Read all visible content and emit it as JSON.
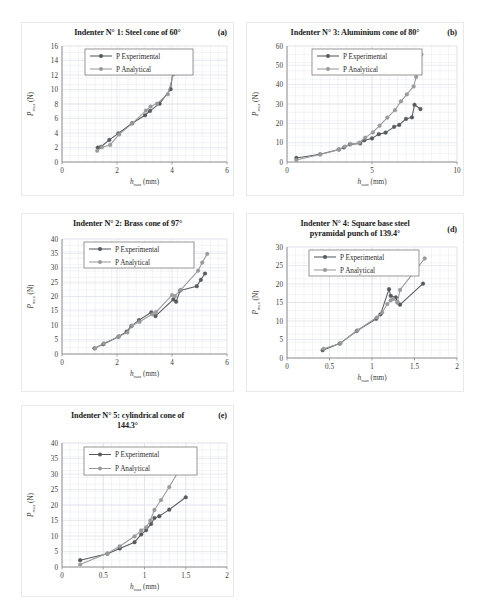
{
  "figure": {
    "background": "#ffffff",
    "panel_border": "#e9e9ec",
    "series_colors": {
      "experimental": "#555a5e",
      "analytical": "#9a9a9a"
    },
    "legend": {
      "experimental_label": "P Experimental",
      "analytical_label": "P Analytical"
    },
    "axis": {
      "y_title_main": "P",
      "y_title_sub": "max",
      "y_title_unit": "(N)",
      "x_title_main": "h",
      "x_title_sub": "max",
      "x_title_unit": "(mm)"
    }
  },
  "chart_data": [
    {
      "type": "line",
      "panel_tag": "(a)",
      "title": "Indenter N° 1: Steel cone of 60°",
      "title_line2": "",
      "xlabel": "h_max (mm)",
      "ylabel": "P_max (N)",
      "xlim": [
        0,
        6
      ],
      "ylim": [
        0,
        16
      ],
      "xticks": [
        0,
        2,
        4,
        6
      ],
      "yticks": [
        0,
        2,
        4,
        6,
        8,
        10,
        12,
        14,
        16
      ],
      "grid": true,
      "legend_position": "top-left",
      "series": [
        {
          "name": "P Experimental",
          "color": "#555a5e",
          "x": [
            1.3,
            1.42,
            1.72,
            2.05,
            2.55,
            3.02,
            3.2,
            3.55,
            3.95,
            4.1
          ],
          "y": [
            2.0,
            2.1,
            3.05,
            3.95,
            5.35,
            6.45,
            7.05,
            8.05,
            10.05,
            14.5
          ]
        },
        {
          "name": "P Analytical",
          "color": "#9a9a9a",
          "x": [
            1.28,
            1.45,
            1.75,
            2.08,
            2.55,
            3.05,
            3.22,
            3.45,
            3.85,
            4.05
          ],
          "y": [
            1.55,
            2.05,
            2.35,
            3.8,
            5.3,
            7.1,
            7.65,
            8.05,
            9.35,
            12.1
          ],
          "x_extra": [
            4.05,
            4.18
          ],
          "y_extra": [
            12.1,
            14.15
          ]
        }
      ]
    },
    {
      "type": "line",
      "panel_tag": "(b)",
      "title": "Indenter N° 3: Aluminium cone of 80°",
      "title_line2": "",
      "xlabel": "h_max (mm)",
      "ylabel": "P_max (N)",
      "xlim": [
        0,
        10
      ],
      "ylim": [
        0,
        60
      ],
      "xticks": [
        0,
        5,
        10
      ],
      "yticks": [
        0,
        10,
        20,
        30,
        40,
        50,
        60
      ],
      "grid": true,
      "legend_position": "top-left",
      "series": [
        {
          "name": "P Experimental",
          "color": "#555a5e",
          "x": [
            0.55,
            1.95,
            3.05,
            3.35,
            3.7,
            4.3,
            4.55,
            5.0,
            5.4,
            5.8,
            6.3,
            6.6,
            7.0,
            7.35,
            7.5,
            7.85
          ],
          "y": [
            2.1,
            4.0,
            6.5,
            7.5,
            9.1,
            9.6,
            11.3,
            12.2,
            14.4,
            15.2,
            18.2,
            19.2,
            22.3,
            23.1,
            29.6,
            27.4
          ]
        },
        {
          "name": "P Analytical",
          "color": "#9a9a9a",
          "x": [
            0.55,
            1.95,
            3.05,
            3.4,
            3.75,
            4.25,
            4.6,
            5.05,
            5.45,
            5.9,
            6.35,
            6.7,
            7.05,
            7.45,
            7.9
          ],
          "y": [
            1.0,
            3.9,
            6.4,
            8.0,
            9.3,
            10.0,
            12.6,
            15.3,
            18.8,
            23.0,
            26.8,
            31.4,
            35.0,
            39.1,
            55.6
          ],
          "x_extra": [
            7.45,
            7.6,
            7.75,
            7.9
          ],
          "y_extra": [
            39.1,
            44.0,
            48.5,
            55.6
          ]
        }
      ]
    },
    {
      "type": "line",
      "panel_tag": "",
      "title": "Indenter N° 2: Brass cone of 97°",
      "title_line2": "",
      "xlabel": "h_max (mm)",
      "ylabel": "P_max (N)",
      "xlim": [
        0,
        6
      ],
      "ylim": [
        0,
        40
      ],
      "xticks": [
        0,
        2,
        4,
        6
      ],
      "yticks": [
        0,
        5,
        10,
        15,
        20,
        25,
        30,
        35,
        40
      ],
      "grid": true,
      "legend_position": "top-left",
      "series": [
        {
          "name": "P Experimental",
          "color": "#555a5e",
          "x": [
            1.18,
            1.5,
            2.05,
            2.35,
            2.52,
            2.8,
            3.25,
            3.4,
            4.05,
            4.15,
            4.3,
            4.9,
            5.05,
            5.2
          ],
          "y": [
            2.0,
            3.4,
            6.0,
            7.8,
            9.7,
            11.8,
            14.5,
            13.2,
            19.0,
            18.2,
            22.1,
            23.6,
            25.8,
            28.0
          ]
        },
        {
          "name": "P Analytical",
          "color": "#9a9a9a",
          "x": [
            1.2,
            1.52,
            2.08,
            2.38,
            2.55,
            2.82,
            3.28,
            3.42,
            4.0,
            4.1,
            4.32,
            4.95,
            5.1,
            5.28
          ],
          "y": [
            1.9,
            3.7,
            6.2,
            7.5,
            9.9,
            11.2,
            13.8,
            14.6,
            20.5,
            20.1,
            22.3,
            29.0,
            31.8,
            34.8
          ]
        }
      ]
    },
    {
      "type": "line",
      "panel_tag": "(d)",
      "title": "Indenter N° 4: Square base steel",
      "title_line2": "pyramidal punch of 139.4°",
      "xlabel": "h_max (mm)",
      "ylabel": "P_max (N)",
      "xlim": [
        0,
        2
      ],
      "ylim": [
        0,
        30
      ],
      "xticks": [
        0,
        0.5,
        1,
        1.5,
        2
      ],
      "xticklabels": [
        "0",
        "0.5",
        "1",
        "1.5",
        "2"
      ],
      "yticks": [
        0,
        5,
        10,
        15,
        20,
        25,
        30
      ],
      "grid": true,
      "legend_position": "top-left",
      "series": [
        {
          "name": "P Experimental",
          "color": "#555a5e",
          "x": [
            0.42,
            0.62,
            0.82,
            1.05,
            1.1,
            1.2,
            1.22,
            1.28,
            1.3,
            1.33,
            1.6
          ],
          "y": [
            2.1,
            3.9,
            7.3,
            10.6,
            11.8,
            18.6,
            16.8,
            16.4,
            15.0,
            14.4,
            20.1
          ]
        },
        {
          "name": "P Analytical",
          "color": "#9a9a9a",
          "x": [
            0.43,
            0.63,
            0.83,
            1.06,
            1.12,
            1.18,
            1.22,
            1.25,
            1.3,
            1.33,
            1.62
          ],
          "y": [
            2.5,
            4.0,
            7.5,
            11.0,
            12.3,
            14.6,
            15.6,
            16.0,
            15.1,
            18.4,
            26.9
          ]
        }
      ]
    },
    {
      "type": "line",
      "panel_tag": "(e)",
      "title": "Indenter N° 5:  cylindrical cone of",
      "title_line2": "144.3°",
      "xlabel": "h_max (mm)",
      "ylabel": "P_max (N)",
      "xlim": [
        0,
        2
      ],
      "ylim": [
        0,
        40
      ],
      "xticks": [
        0,
        0.5,
        1,
        1.5,
        2
      ],
      "xticklabels": [
        "0",
        "0.5",
        "1",
        "1.5",
        "2"
      ],
      "yticks": [
        0,
        5,
        10,
        15,
        20,
        25,
        30,
        35,
        40
      ],
      "grid": true,
      "legend_position": "top-left",
      "series": [
        {
          "name": "P Experimental",
          "color": "#555a5e",
          "x": [
            0.22,
            0.55,
            0.7,
            0.88,
            0.96,
            1.02,
            1.08,
            1.12,
            1.18,
            1.3,
            1.5
          ],
          "y": [
            2.2,
            4.3,
            6.0,
            8.0,
            10.5,
            11.9,
            13.9,
            15.8,
            16.4,
            18.5,
            22.5
          ]
        },
        {
          "name": "P Analytical",
          "color": "#9a9a9a",
          "x": [
            0.22,
            0.55,
            0.7,
            0.88,
            0.96,
            1.02,
            1.07,
            1.12,
            1.2,
            1.3,
            1.5
          ],
          "y": [
            0.8,
            4.4,
            6.7,
            9.9,
            11.8,
            12.8,
            15.0,
            18.4,
            21.6,
            25.8,
            34.9
          ]
        }
      ]
    }
  ]
}
